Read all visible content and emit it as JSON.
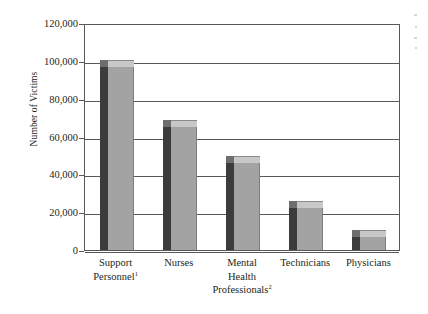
{
  "chart_data": {
    "type": "bar",
    "title": "",
    "subtitle": "",
    "xlabel": "",
    "ylabel": "Number of Victims",
    "ylim": [
      0,
      120000
    ],
    "ytick_step": 20000,
    "yticks": [
      "0",
      "20,000",
      "40,000",
      "60,000",
      "80,000",
      "100,000",
      "120,000"
    ],
    "ytick_values": [
      0,
      20000,
      40000,
      60000,
      80000,
      100000,
      120000
    ],
    "grid": true,
    "legend": "none",
    "style": "3d-bar",
    "categories": [
      "Support Personnel",
      "Nurses",
      "Mental Health Professionals",
      "Technicians",
      "Physicians"
    ],
    "category_lines": [
      [
        "Support",
        "Personnel"
      ],
      [
        "Nurses"
      ],
      [
        "Mental",
        "Health",
        "Professionals"
      ],
      [
        "Technicians"
      ],
      [
        "Physicians"
      ]
    ],
    "category_footnotes": [
      "1",
      "",
      "2",
      "",
      ""
    ],
    "values": [
      97000,
      65000,
      46000,
      22000,
      7000
    ],
    "colors": {
      "bar_front": "#a3a3a3",
      "bar_side": "#3c3c3c",
      "bar_top": "#c8c8c8",
      "axis": "#58585a",
      "text": "#231f20",
      "background": "#ffffff"
    }
  },
  "axis": {
    "y_title": "Number of Victims"
  }
}
